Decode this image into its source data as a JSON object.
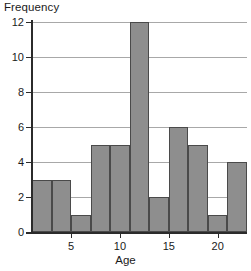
{
  "chart_data": {
    "type": "bar",
    "title": "",
    "subtitle": "",
    "xlabel": "Age",
    "ylabel": "Frequency",
    "categories": [
      "1-3",
      "3-5",
      "5-7",
      "7-9",
      "9-11",
      "11-13",
      "13-15",
      "15-17",
      "17-19",
      "19-21",
      "21-23"
    ],
    "bin_edges": [
      1,
      3,
      5,
      7,
      9,
      11,
      13,
      15,
      17,
      19,
      21,
      23
    ],
    "values": [
      3,
      3,
      1,
      5,
      5,
      12,
      2,
      6,
      5,
      1,
      4
    ],
    "bin_width": 2,
    "xlim": [
      1,
      23
    ],
    "ylim": [
      0,
      12
    ],
    "x_ticks": [
      5,
      10,
      15,
      20
    ],
    "x_tick_labels": [
      "5",
      "10",
      "15",
      "20"
    ],
    "y_ticks": [
      0,
      2,
      4,
      6,
      8,
      10,
      12
    ],
    "y_tick_labels": [
      "0",
      "2",
      "4",
      "6",
      "8",
      "10",
      "12"
    ],
    "grid": "horizontal",
    "legend": "none",
    "bar_fill_color": "#8e8e8e",
    "bar_border_color": "#4a4a4a",
    "gridline_color": "#a8a8a8",
    "axis_color": "#2b2b2b"
  }
}
